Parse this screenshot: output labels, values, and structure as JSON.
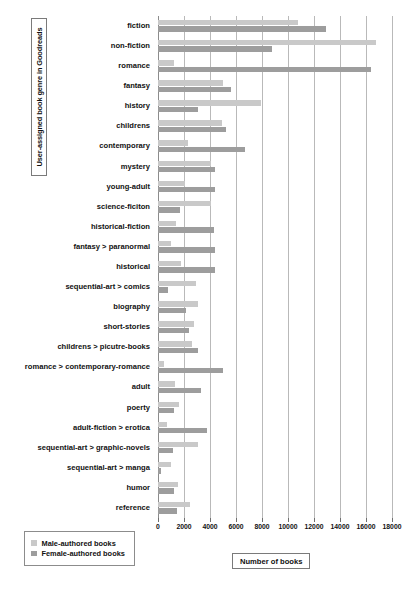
{
  "chart_data": {
    "type": "bar",
    "orientation": "horizontal",
    "title": "",
    "xlabel": "Number of books",
    "ylabel": "User-assigned book genre in Goodreads",
    "xlim": [
      0,
      18000
    ],
    "xticks": [
      0,
      2000,
      4000,
      6000,
      8000,
      10000,
      12000,
      14000,
      16000,
      18000
    ],
    "xtick_labels": [
      "0",
      "2000",
      "4000",
      "6000",
      "8000",
      "10000",
      "12000",
      "14000",
      "16000",
      "18000"
    ],
    "grid": "vertical",
    "legend_position": "bottom-left",
    "categories": [
      "fiction",
      "non-fiction",
      "romance",
      "fantasy",
      "history",
      "childrens",
      "contemporary",
      "mystery",
      "young-adult",
      "science-ficiton",
      "historical-fiction",
      "fantasy > paranormal",
      "historical",
      "sequential-art > comics",
      "biography",
      "short-stories",
      "childrens > picutre-books",
      "romance > contemporary-romance",
      "adult",
      "poerty",
      "adult-fiction > erotica",
      "sequential-art > graphic-novels",
      "sequential-art > manga",
      "humor",
      "reference"
    ],
    "series": [
      {
        "name": "Male-authored books",
        "color": "#c9c9c9",
        "values": [
          10800,
          16800,
          1250,
          5000,
          7900,
          4900,
          2300,
          4100,
          2100,
          4100,
          1350,
          1000,
          1750,
          2950,
          3050,
          2750,
          2600,
          450,
          1300,
          1650,
          700,
          3100,
          1000,
          1550,
          2450
        ]
      },
      {
        "name": "Female-authored books",
        "color": "#9d9d9d",
        "values": [
          12900,
          8800,
          16400,
          5600,
          3100,
          5200,
          6700,
          4400,
          4350,
          1700,
          4300,
          4400,
          4400,
          750,
          2150,
          2400,
          3100,
          5000,
          3300,
          1200,
          3800,
          1150,
          250,
          1250,
          1450
        ]
      }
    ]
  },
  "legend": {
    "items": [
      {
        "label": "Male-authored books",
        "color": "#c9c9c9"
      },
      {
        "label": "Female-authored books",
        "color": "#9d9d9d"
      }
    ]
  }
}
